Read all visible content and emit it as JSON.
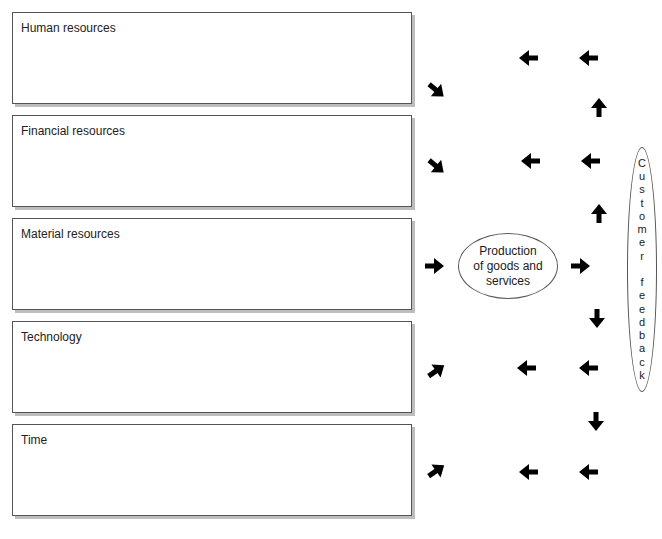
{
  "diagram": {
    "resource_boxes": [
      {
        "label": "Human resources"
      },
      {
        "label": "Financial resources"
      },
      {
        "label": "Material resources"
      },
      {
        "label": "Technology"
      },
      {
        "label": "Time"
      }
    ],
    "production_node": {
      "lines": [
        "Production",
        "of goods and",
        "services"
      ]
    },
    "feedback_node": {
      "letters": [
        "C",
        "u",
        "s",
        "t",
        "o",
        "m",
        "e",
        "r",
        "",
        "f",
        "e",
        "e",
        "d",
        "b",
        "a",
        "c",
        "k"
      ]
    },
    "arrows": [
      {
        "direction": "down-right",
        "row": 1,
        "column": 1
      },
      {
        "direction": "left",
        "row": 1,
        "column": 2
      },
      {
        "direction": "left",
        "row": 1,
        "column": 3
      },
      {
        "direction": "up",
        "between_rows": "1-2",
        "column": 3
      },
      {
        "direction": "down-right",
        "row": 2,
        "column": 1
      },
      {
        "direction": "left",
        "row": 2,
        "column": 2
      },
      {
        "direction": "left",
        "row": 2,
        "column": 3
      },
      {
        "direction": "up",
        "between_rows": "2-3",
        "column": 3
      },
      {
        "direction": "right",
        "row": 3,
        "column": 1
      },
      {
        "direction": "right",
        "row": 3,
        "column": 3
      },
      {
        "direction": "down",
        "between_rows": "3-4",
        "column": 3
      },
      {
        "direction": "up-right",
        "row": 4,
        "column": 1
      },
      {
        "direction": "left",
        "row": 4,
        "column": 2
      },
      {
        "direction": "left",
        "row": 4,
        "column": 3
      },
      {
        "direction": "down",
        "between_rows": "4-5",
        "column": 3
      },
      {
        "direction": "up-right",
        "row": 5,
        "column": 1
      },
      {
        "direction": "left",
        "row": 5,
        "column": 2
      },
      {
        "direction": "left",
        "row": 5,
        "column": 3
      }
    ],
    "colors": {
      "stroke": "#555555",
      "arrow": "#000000",
      "shadow": "#bdbdbd"
    }
  }
}
